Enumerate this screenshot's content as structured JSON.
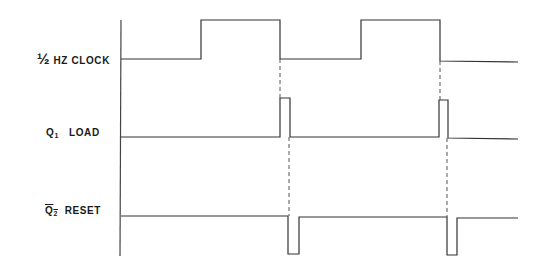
{
  "diagram": {
    "type": "timing-diagram",
    "signals": [
      {
        "id": "clock",
        "label_prefix": "½",
        "label_text": "HZ  CLOCK"
      },
      {
        "id": "q1",
        "label_main": "Q",
        "label_sub": "1",
        "label_text": "LOAD"
      },
      {
        "id": "q2bar",
        "label_main": "Q",
        "label_sub": "2",
        "label_text": "RESET",
        "inverted": true
      }
    ],
    "axis_x": 121,
    "line_color": "#333333",
    "waveforms": {
      "clock": "M121,59 L201,59 L201,20 L280,20 L280,59 L361,59 L361,20 L440,20 L440,61 L518,62",
      "q1": "M121,137 L280,137 L280,98 L290,98 L290,137 L439,137 L439,100 L448,100 L448,138 L518,139",
      "q2bar": "M121,216 L288,216 L288,254 L299,254 L299,217 L447,217 L447,255 L457,255 L457,218 L518,218"
    },
    "dashed": [
      {
        "x1": 280,
        "y1": 59,
        "x2": 280,
        "y2": 98
      },
      {
        "x1": 289,
        "y1": 137,
        "x2": 289,
        "y2": 216
      },
      {
        "x1": 440,
        "y1": 61,
        "x2": 440,
        "y2": 100
      },
      {
        "x1": 447,
        "y1": 138,
        "x2": 447,
        "y2": 217
      }
    ]
  }
}
